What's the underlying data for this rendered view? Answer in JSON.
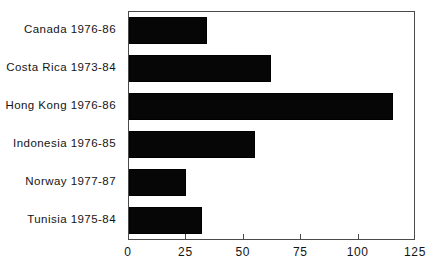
{
  "chart_data": {
    "type": "bar",
    "orientation": "horizontal",
    "title": "",
    "subtitle": "",
    "xlabel": "",
    "ylabel": "",
    "categories": [
      "Canada 1976-86",
      "Costa Rica 1973-84",
      "Hong Kong 1976-86",
      "Indonesia 1976-85",
      "Norway 1977-87",
      "Tunisia 1975-84"
    ],
    "values": [
      34,
      62,
      115,
      55,
      25,
      32
    ],
    "xlim": [
      0,
      125
    ],
    "xticks": [
      0,
      25,
      50,
      75,
      100,
      125
    ],
    "xtick_labels": [
      "0",
      "25",
      "50",
      "75",
      "100",
      "125"
    ],
    "grid": false,
    "legend": null,
    "bar_color": "#060606",
    "frame_color": "#4a4a4a",
    "background_color": "#ffffff"
  }
}
